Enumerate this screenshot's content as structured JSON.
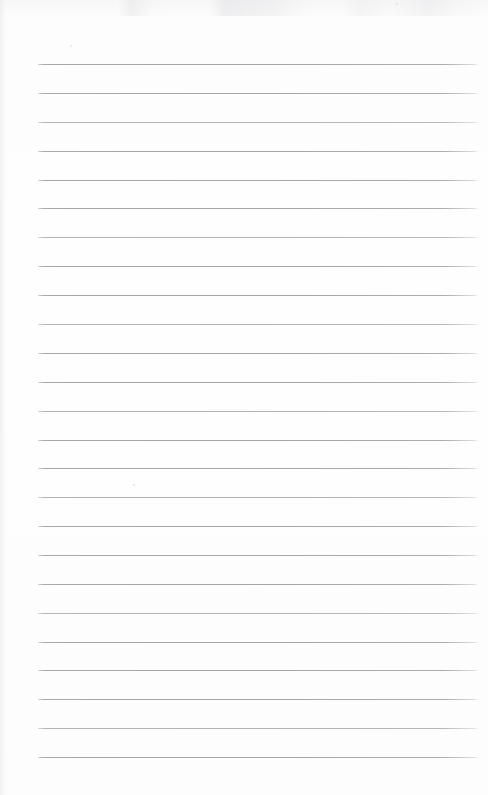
{
  "page": {
    "width_px": 488,
    "height_px": 795,
    "paper_color": "#fdfdfd",
    "background_color": "#ffffff",
    "content_text": ""
  },
  "ruling": {
    "line_color": "#a8a8ac",
    "line_thickness_px": 1,
    "line_count": 25,
    "first_line_y_px": 64,
    "last_line_y_px": 757,
    "line_spacing_px": 28.88,
    "left_margin_px": 38,
    "right_edge_px": 478,
    "line_length_px": 440,
    "top_margin_px": 64,
    "bottom_margin_px": 38,
    "has_vertical_margin_rule": false,
    "has_header_rule": false
  },
  "lines": [
    {
      "index": 1,
      "y": 64,
      "tone": "strong"
    },
    {
      "index": 2,
      "y": 93,
      "tone": "strong"
    },
    {
      "index": 3,
      "y": 122,
      "tone": "faint"
    },
    {
      "index": 4,
      "y": 151,
      "tone": "strong"
    },
    {
      "index": 5,
      "y": 180,
      "tone": "strong"
    },
    {
      "index": 6,
      "y": 208,
      "tone": "strong"
    },
    {
      "index": 7,
      "y": 237,
      "tone": "faint"
    },
    {
      "index": 8,
      "y": 266,
      "tone": "strong"
    },
    {
      "index": 9,
      "y": 295,
      "tone": "strong"
    },
    {
      "index": 10,
      "y": 324,
      "tone": "faint"
    },
    {
      "index": 11,
      "y": 353,
      "tone": "strong"
    },
    {
      "index": 12,
      "y": 382,
      "tone": "strong"
    },
    {
      "index": 13,
      "y": 411,
      "tone": "faint"
    },
    {
      "index": 14,
      "y": 440,
      "tone": "strong"
    },
    {
      "index": 15,
      "y": 468,
      "tone": "strong"
    },
    {
      "index": 16,
      "y": 497,
      "tone": "faint"
    },
    {
      "index": 17,
      "y": 526,
      "tone": "strong"
    },
    {
      "index": 18,
      "y": 555,
      "tone": "strong"
    },
    {
      "index": 19,
      "y": 584,
      "tone": "strong"
    },
    {
      "index": 20,
      "y": 613,
      "tone": "faint"
    },
    {
      "index": 21,
      "y": 642,
      "tone": "strong"
    },
    {
      "index": 22,
      "y": 670,
      "tone": "strong"
    },
    {
      "index": 23,
      "y": 699,
      "tone": "strong"
    },
    {
      "index": 24,
      "y": 728,
      "tone": "faint"
    },
    {
      "index": 25,
      "y": 757,
      "tone": "strong"
    }
  ],
  "specks": [
    {
      "x": 70,
      "y": 45,
      "size": 2
    },
    {
      "x": 133,
      "y": 484,
      "size": 2
    },
    {
      "x": 396,
      "y": 3,
      "size": 2
    }
  ]
}
